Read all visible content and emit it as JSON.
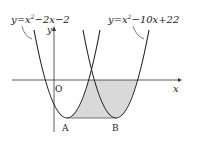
{
  "diagram": {
    "type": "parabola-graph",
    "curves": [
      {
        "name": "parabola-1",
        "equation_label": "y=x²−2x−2",
        "base": "y=x",
        "sup": "2",
        "rest": "−2x−2",
        "vertex": [
          1,
          -3
        ]
      },
      {
        "name": "parabola-2",
        "equation_label": "y=x²−10x+22",
        "base": "y=x",
        "sup": "2",
        "rest": "−10x+22",
        "vertex": [
          5,
          -3
        ]
      }
    ],
    "axes": {
      "x_label": "x",
      "y_label": "y",
      "origin_label": "O"
    },
    "points": [
      {
        "label": "A",
        "coords": [
          1,
          -3
        ]
      },
      {
        "label": "B",
        "coords": [
          5,
          -3
        ]
      }
    ],
    "shaded_region": "Region bounded by the two parabolas, the x-axis and segment AB",
    "colors": {
      "curve": "#222222",
      "shade": "#d9d9d9",
      "axis": "#333333"
    }
  }
}
